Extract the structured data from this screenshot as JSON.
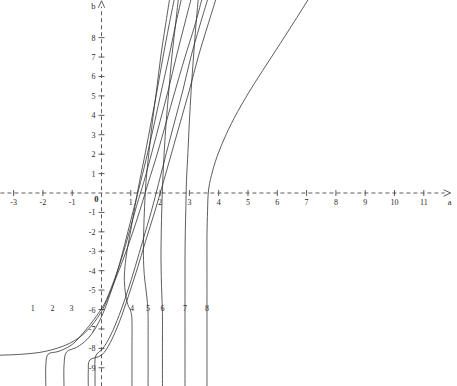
{
  "figure": {
    "width": 457,
    "height": 386,
    "background_color": "#ffffff",
    "line_color": "#333333",
    "axis_color": "#4a4a4a"
  },
  "chart_data": {
    "type": "line",
    "title": "",
    "subtitle": "",
    "xlabel": "a",
    "ylabel": "b",
    "xlim": [
      -3.45,
      11.95
    ],
    "ylim": [
      -9.95,
      9.95
    ],
    "grid": false,
    "legend": "none",
    "axis_style": "dashed-arrow-cartesian",
    "origin_label": "0",
    "xticks": [
      -3,
      -2,
      -1,
      1,
      2,
      3,
      4,
      5,
      6,
      7,
      8,
      9,
      10,
      11
    ],
    "xtick_labels": [
      "-3",
      "-2",
      "-1",
      "1",
      "2",
      "3",
      "4",
      "5",
      "6",
      "7",
      "8",
      "9",
      "10",
      "11"
    ],
    "yticks": [
      8,
      7,
      6,
      5,
      4,
      3,
      2,
      1,
      -1,
      -2,
      -3,
      -4,
      -5,
      -6,
      -7,
      -8,
      -9
    ],
    "ytick_labels": [
      "8",
      "7",
      "6",
      "5",
      "4",
      "3",
      "2",
      "1",
      "-1",
      "-2",
      "-3",
      "-4",
      "-5",
      "-6",
      "-7",
      "-8",
      "-9"
    ],
    "pixel_mapping": {
      "x_origin_px": 101.5,
      "y_origin_px": 193.0,
      "x_unit_px": 29.3,
      "y_unit_px": 19.42
    },
    "annotations": [
      {
        "text": "1",
        "a": -2.35,
        "b": -6.1
      },
      {
        "text": "2",
        "a": -1.67,
        "b": -6.1
      },
      {
        "text": "3",
        "a": -1.02,
        "b": -6.1
      },
      {
        "text": "4",
        "a": 1.04,
        "b": -6.1
      },
      {
        "text": "5",
        "a": 1.59,
        "b": -6.1
      },
      {
        "text": "6",
        "a": 2.08,
        "b": -6.1
      },
      {
        "text": "7",
        "a": 2.85,
        "b": -6.1
      },
      {
        "text": "8",
        "a": 3.6,
        "b": -6.1
      }
    ],
    "series": [
      {
        "name": "1",
        "label": "1",
        "points_ab": [
          [
            3.42,
            9.95
          ],
          [
            3.18,
            8.6
          ],
          [
            2.85,
            7.0
          ],
          [
            2.5,
            5.2
          ],
          [
            2.2,
            3.6
          ],
          [
            1.9,
            2.0
          ],
          [
            1.6,
            0.55
          ],
          [
            1.35,
            -0.7
          ],
          [
            1.05,
            -2.1
          ],
          [
            0.72,
            -3.5
          ],
          [
            0.35,
            -4.9
          ],
          [
            0.0,
            -6.1
          ],
          [
            -0.5,
            -7.1
          ],
          [
            -1.1,
            -7.75
          ],
          [
            -1.9,
            -8.15
          ],
          [
            -2.7,
            -8.3
          ],
          [
            -3.45,
            -8.35
          ]
        ]
      },
      {
        "name": "2",
        "label": "2",
        "points_ab": [
          [
            3.05,
            9.95
          ],
          [
            2.82,
            8.6
          ],
          [
            2.55,
            7.0
          ],
          [
            2.28,
            5.3
          ],
          [
            2.0,
            3.7
          ],
          [
            1.72,
            2.1
          ],
          [
            1.45,
            0.6
          ],
          [
            1.2,
            -0.65
          ],
          [
            0.95,
            -2.0
          ],
          [
            0.68,
            -3.4
          ],
          [
            0.38,
            -4.7
          ],
          [
            0.1,
            -5.7
          ],
          [
            -0.25,
            -6.5
          ],
          [
            -0.62,
            -7.2
          ],
          [
            -1.0,
            -7.8
          ],
          [
            -1.45,
            -8.15
          ],
          [
            -1.82,
            -8.3
          ],
          [
            -1.9,
            -8.9
          ],
          [
            -1.9,
            -9.95
          ]
        ]
      },
      {
        "name": "3",
        "label": "3",
        "points_ab": [
          [
            2.72,
            9.95
          ],
          [
            2.52,
            8.6
          ],
          [
            2.3,
            7.0
          ],
          [
            2.05,
            5.3
          ],
          [
            1.82,
            3.7
          ],
          [
            1.58,
            2.1
          ],
          [
            1.34,
            0.6
          ],
          [
            1.12,
            -0.7
          ],
          [
            0.9,
            -2.0
          ],
          [
            0.68,
            -3.3
          ],
          [
            0.45,
            -4.5
          ],
          [
            0.25,
            -5.4
          ],
          [
            0.05,
            -6.2
          ],
          [
            -0.2,
            -6.95
          ],
          [
            -0.5,
            -7.55
          ],
          [
            -0.85,
            -7.95
          ],
          [
            -1.2,
            -8.2
          ],
          [
            -1.28,
            -8.9
          ],
          [
            -1.28,
            -9.95
          ]
        ]
      },
      {
        "name": "4",
        "label": "4",
        "points_ab": [
          [
            2.48,
            9.95
          ],
          [
            2.3,
            8.6
          ],
          [
            2.1,
            7.0
          ],
          [
            1.9,
            5.3
          ],
          [
            1.7,
            3.7
          ],
          [
            1.5,
            2.1
          ],
          [
            1.3,
            0.6
          ],
          [
            1.14,
            -0.7
          ],
          [
            1.0,
            -1.9
          ],
          [
            0.88,
            -2.9
          ],
          [
            0.8,
            -3.8
          ],
          [
            0.78,
            -4.5
          ],
          [
            0.82,
            -5.2
          ],
          [
            0.9,
            -5.75
          ],
          [
            1.0,
            -6.1
          ],
          [
            1.04,
            -6.6
          ],
          [
            1.04,
            -8.0
          ],
          [
            1.04,
            -9.95
          ]
        ]
      },
      {
        "name": "5",
        "label": "5",
        "points_ab": [
          [
            2.32,
            9.95
          ],
          [
            2.18,
            8.6
          ],
          [
            2.02,
            7.0
          ],
          [
            1.88,
            5.3
          ],
          [
            1.74,
            3.7
          ],
          [
            1.62,
            2.1
          ],
          [
            1.52,
            0.6
          ],
          [
            1.47,
            -0.7
          ],
          [
            1.44,
            -2.0
          ],
          [
            1.43,
            -3.2
          ],
          [
            1.46,
            -4.2
          ],
          [
            1.52,
            -5.0
          ],
          [
            1.57,
            -5.7
          ],
          [
            1.59,
            -6.4
          ],
          [
            1.59,
            -8.0
          ],
          [
            1.59,
            -9.95
          ]
        ]
      },
      {
        "name": "6",
        "label": "6",
        "points_ab": [
          [
            2.62,
            9.95
          ],
          [
            2.52,
            8.6
          ],
          [
            2.4,
            7.0
          ],
          [
            2.3,
            5.3
          ],
          [
            2.21,
            3.7
          ],
          [
            2.14,
            2.1
          ],
          [
            2.09,
            0.6
          ],
          [
            2.06,
            -0.7
          ],
          [
            2.04,
            -2.0
          ],
          [
            2.03,
            -3.2
          ],
          [
            2.04,
            -4.3
          ],
          [
            2.06,
            -5.3
          ],
          [
            2.08,
            -6.2
          ],
          [
            2.08,
            -8.0
          ],
          [
            2.08,
            -9.95
          ]
        ]
      },
      {
        "name": "7",
        "label": "7",
        "points_ab": [
          [
            3.3,
            9.95
          ],
          [
            3.22,
            8.6
          ],
          [
            3.14,
            7.0
          ],
          [
            3.06,
            5.3
          ],
          [
            3.0,
            3.7
          ],
          [
            2.95,
            2.1
          ],
          [
            2.9,
            0.6
          ],
          [
            2.88,
            -0.7
          ],
          [
            2.86,
            -2.0
          ],
          [
            2.85,
            -3.4
          ],
          [
            2.85,
            -4.8
          ],
          [
            2.85,
            -6.2
          ],
          [
            2.85,
            -8.0
          ],
          [
            2.85,
            -9.95
          ]
        ]
      },
      {
        "name": "8",
        "label": "8",
        "points_ab": [
          [
            7.05,
            9.95
          ],
          [
            6.4,
            8.4
          ],
          [
            5.8,
            7.0
          ],
          [
            5.2,
            5.6
          ],
          [
            4.65,
            4.2
          ],
          [
            4.25,
            3.0
          ],
          [
            3.95,
            1.9
          ],
          [
            3.75,
            0.9
          ],
          [
            3.65,
            0.1
          ],
          [
            3.62,
            -0.9
          ],
          [
            3.6,
            -2.2
          ],
          [
            3.6,
            -3.6
          ],
          [
            3.6,
            -5.0
          ],
          [
            3.6,
            -6.5
          ],
          [
            3.6,
            -8.0
          ],
          [
            3.6,
            -9.95
          ]
        ]
      },
      {
        "name": "9",
        "label": "",
        "points_ab": [
          [
            3.9,
            9.95
          ],
          [
            3.62,
            8.6
          ],
          [
            3.3,
            7.0
          ],
          [
            3.0,
            5.3
          ],
          [
            2.7,
            3.7
          ],
          [
            2.4,
            2.1
          ],
          [
            2.1,
            0.5
          ],
          [
            1.82,
            -0.95
          ],
          [
            1.5,
            -2.5
          ],
          [
            1.22,
            -3.9
          ],
          [
            0.92,
            -5.3
          ],
          [
            0.62,
            -6.6
          ],
          [
            0.3,
            -7.7
          ],
          [
            0.0,
            -8.35
          ],
          [
            -0.4,
            -8.6
          ],
          [
            -0.45,
            -9.2
          ],
          [
            -0.45,
            -9.95
          ]
        ]
      },
      {
        "name": "10",
        "label": "",
        "points_ab": [
          [
            3.62,
            9.95
          ],
          [
            3.35,
            8.6
          ],
          [
            3.05,
            7.0
          ],
          [
            2.78,
            5.3
          ],
          [
            2.5,
            3.7
          ],
          [
            2.22,
            2.1
          ],
          [
            1.95,
            0.5
          ],
          [
            1.7,
            -0.95
          ],
          [
            1.42,
            -2.4
          ],
          [
            1.15,
            -3.8
          ],
          [
            0.88,
            -5.1
          ],
          [
            0.6,
            -6.3
          ],
          [
            0.32,
            -7.3
          ],
          [
            0.05,
            -8.0
          ],
          [
            -0.2,
            -8.4
          ],
          [
            -0.22,
            -9.2
          ],
          [
            -0.22,
            -9.95
          ]
        ]
      }
    ]
  }
}
